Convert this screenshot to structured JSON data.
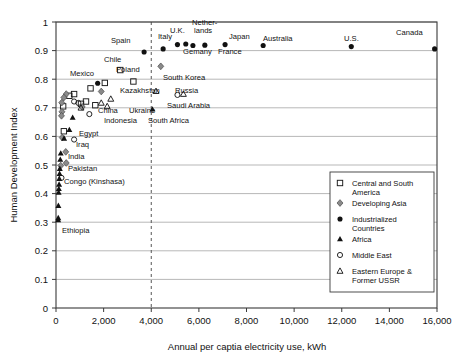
{
  "chart_data": {
    "type": "scatter",
    "title": "",
    "xlabel": "Annual per captia electricity use, kWh",
    "ylabel": "Human Development Index",
    "xlim": [
      0,
      16000
    ],
    "ylim": [
      0,
      1
    ],
    "xticks": [
      0,
      2000,
      4000,
      6000,
      8000,
      10000,
      12000,
      14000,
      16000
    ],
    "xticklabels": [
      "0",
      "2,000",
      "4,000",
      "6,000",
      "8,000",
      "10,000",
      "12,000",
      "14,000",
      "16,000"
    ],
    "yticks": [
      0,
      0.1,
      0.2,
      0.3,
      0.4,
      0.5,
      0.6,
      0.7,
      0.8,
      0.9,
      1
    ],
    "yticklabels": [
      "0",
      "0.1",
      "0.2",
      "0.3",
      "0.4",
      "0.5",
      "0.6",
      "0.7",
      "0.8",
      "0.9",
      "1"
    ],
    "grid": "horizontal",
    "legend_position": "bottom-right",
    "annotations": [
      {
        "name": "reference-line-4000",
        "type": "vline",
        "x": 4000,
        "style": "dashed"
      }
    ],
    "series": [
      {
        "name": "Central and South America",
        "marker": "open-square",
        "points": [
          {
            "x": 2700,
            "y": 0.832,
            "label": "Chile"
          },
          {
            "x": 3250,
            "y": 0.792,
            "label": ""
          },
          {
            "x": 1450,
            "y": 0.768,
            "label": ""
          },
          {
            "x": 760,
            "y": 0.748,
            "label": ""
          },
          {
            "x": 560,
            "y": 0.742,
            "label": ""
          },
          {
            "x": 1260,
            "y": 0.722,
            "label": ""
          },
          {
            "x": 1050,
            "y": 0.714,
            "label": ""
          },
          {
            "x": 1650,
            "y": 0.709,
            "label": ""
          },
          {
            "x": 300,
            "y": 0.705,
            "label": ""
          },
          {
            "x": 330,
            "y": 0.618,
            "label": ""
          },
          {
            "x": 2050,
            "y": 0.787,
            "label": "Poland"
          }
        ]
      },
      {
        "name": "Developing Asia",
        "marker": "diamond",
        "points": [
          {
            "x": 4400,
            "y": 0.845,
            "label": "South Korea"
          },
          {
            "x": 1900,
            "y": 0.757,
            "label": ""
          },
          {
            "x": 430,
            "y": 0.748,
            "label": ""
          },
          {
            "x": 330,
            "y": 0.736,
            "label": ""
          },
          {
            "x": 240,
            "y": 0.718,
            "label": ""
          },
          {
            "x": 1100,
            "y": 0.703,
            "label": "China"
          },
          {
            "x": 250,
            "y": 0.686,
            "label": ""
          },
          {
            "x": 230,
            "y": 0.672,
            "label": ""
          },
          {
            "x": 260,
            "y": 0.596,
            "label": ""
          },
          {
            "x": 410,
            "y": 0.546,
            "label": "India"
          },
          {
            "x": 430,
            "y": 0.507,
            "label": "Pakistan"
          },
          {
            "x": 200,
            "y": 0.498,
            "label": ""
          }
        ]
      },
      {
        "name": "Industrialized Countries",
        "marker": "filled-circle",
        "points": [
          {
            "x": 15900,
            "y": 0.906,
            "label": "Canada"
          },
          {
            "x": 12400,
            "y": 0.914,
            "label": "U.S."
          },
          {
            "x": 8700,
            "y": 0.918,
            "label": "Australia"
          },
          {
            "x": 7100,
            "y": 0.921,
            "label": "Japan"
          },
          {
            "x": 5750,
            "y": 0.918,
            "label": "Gemany"
          },
          {
            "x": 6250,
            "y": 0.919,
            "label": "France"
          },
          {
            "x": 5450,
            "y": 0.923,
            "label": "Nether-lands"
          },
          {
            "x": 5100,
            "y": 0.921,
            "label": "U.K."
          },
          {
            "x": 4500,
            "y": 0.906,
            "label": "Italy"
          },
          {
            "x": 3700,
            "y": 0.895,
            "label": "Spain"
          },
          {
            "x": 1750,
            "y": 0.786,
            "label": "Mexico"
          }
        ]
      },
      {
        "name": "Africa",
        "marker": "triangle",
        "points": [
          {
            "x": 4050,
            "y": 0.695,
            "label": "South Africa"
          },
          {
            "x": 700,
            "y": 0.666,
            "label": ""
          },
          {
            "x": 560,
            "y": 0.623,
            "label": "Egypt"
          },
          {
            "x": 340,
            "y": 0.593,
            "label": ""
          },
          {
            "x": 200,
            "y": 0.541,
            "label": ""
          },
          {
            "x": 180,
            "y": 0.519,
            "label": ""
          },
          {
            "x": 160,
            "y": 0.487,
            "label": "Congo (Kinshasa)"
          },
          {
            "x": 150,
            "y": 0.47,
            "label": ""
          },
          {
            "x": 140,
            "y": 0.452,
            "label": ""
          },
          {
            "x": 130,
            "y": 0.432,
            "label": ""
          },
          {
            "x": 120,
            "y": 0.417,
            "label": ""
          },
          {
            "x": 110,
            "y": 0.404,
            "label": ""
          },
          {
            "x": 100,
            "y": 0.358,
            "label": ""
          },
          {
            "x": 95,
            "y": 0.315,
            "label": ""
          },
          {
            "x": 90,
            "y": 0.308,
            "label": "Ethiopia"
          }
        ]
      },
      {
        "name": "Middle East",
        "marker": "open-circle",
        "points": [
          {
            "x": 5100,
            "y": 0.745,
            "label": ""
          },
          {
            "x": 760,
            "y": 0.722,
            "label": ""
          },
          {
            "x": 940,
            "y": 0.717,
            "label": ""
          },
          {
            "x": 1400,
            "y": 0.678,
            "label": "Indonesia"
          },
          {
            "x": 760,
            "y": 0.589,
            "label": "Iraq"
          },
          {
            "x": 230,
            "y": 0.455,
            "label": ""
          }
        ]
      },
      {
        "name": "Eastern Europe & Former USSR",
        "marker": "open-triangle",
        "points": [
          {
            "x": 4200,
            "y": 0.758,
            "label": "Kazakhstan"
          },
          {
            "x": 5350,
            "y": 0.748,
            "label": "Russia"
          },
          {
            "x": 2300,
            "y": 0.731,
            "label": ""
          },
          {
            "x": 1900,
            "y": 0.717,
            "label": ""
          },
          {
            "x": 2150,
            "y": 0.705,
            "label": "Ukraine"
          },
          {
            "x": 1050,
            "y": 0.7,
            "label": ""
          }
        ]
      }
    ]
  },
  "legend": {
    "entries": [
      {
        "marker": "open-square",
        "label_line1": "Central and South",
        "label_line2": "America"
      },
      {
        "marker": "diamond",
        "label_line1": "Developing Asia",
        "label_line2": ""
      },
      {
        "marker": "filled-circle",
        "label_line1": "Industrialized",
        "label_line2": "Countries"
      },
      {
        "marker": "triangle",
        "label_line1": "Africa",
        "label_line2": ""
      },
      {
        "marker": "open-circle",
        "label_line1": "Middle East",
        "label_line2": ""
      },
      {
        "marker": "open-triangle",
        "label_line1": "Eastern Europe &",
        "label_line2": "Former USSR"
      }
    ]
  },
  "point_labels": [
    {
      "name": "label-canada",
      "text": "Canada",
      "x": 396,
      "y": 35,
      "anchor": "start"
    },
    {
      "name": "label-us",
      "text": "U.S.",
      "x": 344,
      "y": 41,
      "anchor": "start"
    },
    {
      "name": "label-australia",
      "text": "Australia",
      "x": 263,
      "y": 41,
      "anchor": "start"
    },
    {
      "name": "label-japan",
      "text": "Japan",
      "x": 229,
      "y": 39,
      "anchor": "start"
    },
    {
      "name": "label-netherlands-1",
      "text": "Nether-",
      "x": 192,
      "y": 25,
      "anchor": "start"
    },
    {
      "name": "label-netherlands-2",
      "text": "lands",
      "x": 194,
      "y": 33,
      "anchor": "start"
    },
    {
      "name": "label-uk",
      "text": "U.K.",
      "x": 170,
      "y": 33,
      "anchor": "start"
    },
    {
      "name": "label-italy",
      "text": "Italy",
      "x": 158,
      "y": 39,
      "anchor": "start"
    },
    {
      "name": "label-spain",
      "text": "Spain",
      "x": 111,
      "y": 43,
      "anchor": "start"
    },
    {
      "name": "label-gemany",
      "text": "Gemany",
      "x": 183,
      "y": 54,
      "anchor": "start"
    },
    {
      "name": "label-france",
      "text": "France",
      "x": 218,
      "y": 54,
      "anchor": "start"
    },
    {
      "name": "label-chile",
      "text": "Chile",
      "x": 104,
      "y": 62,
      "anchor": "start"
    },
    {
      "name": "label-poland",
      "text": "Poland",
      "x": 116,
      "y": 72,
      "anchor": "start"
    },
    {
      "name": "label-south-korea",
      "text": "South Korea",
      "x": 163,
      "y": 80,
      "anchor": "start"
    },
    {
      "name": "label-mexico",
      "text": "Mexico",
      "x": 70,
      "y": 76,
      "anchor": "start"
    },
    {
      "name": "label-kazakhstan",
      "text": "Kazakhstan",
      "x": 120,
      "y": 93,
      "anchor": "start"
    },
    {
      "name": "label-russia",
      "text": "Russia",
      "x": 175,
      "y": 93,
      "anchor": "start"
    },
    {
      "name": "label-saudi-arabia",
      "text": "Saudi Arabia",
      "x": 167,
      "y": 108,
      "anchor": "start"
    },
    {
      "name": "label-china",
      "text": "China",
      "x": 98,
      "y": 113,
      "anchor": "start"
    },
    {
      "name": "label-ukraine",
      "text": "Ukraine",
      "x": 129,
      "y": 113,
      "anchor": "start"
    },
    {
      "name": "label-indonesia",
      "text": "Indonesia",
      "x": 104,
      "y": 123,
      "anchor": "start"
    },
    {
      "name": "label-south-africa",
      "text": "South Africa",
      "x": 148,
      "y": 123,
      "anchor": "start"
    },
    {
      "name": "label-egypt",
      "text": "Egypt",
      "x": 79,
      "y": 136,
      "anchor": "start"
    },
    {
      "name": "label-iraq",
      "text": "Iraq",
      "x": 76,
      "y": 147,
      "anchor": "start"
    },
    {
      "name": "label-india",
      "text": "India",
      "x": 68,
      "y": 159,
      "anchor": "start"
    },
    {
      "name": "label-pakistan",
      "text": "Pakistan",
      "x": 68,
      "y": 171,
      "anchor": "start"
    },
    {
      "name": "label-congo",
      "text": "Congo (Kinshasa)",
      "x": 64,
      "y": 184,
      "anchor": "start"
    },
    {
      "name": "label-ethiopia",
      "text": "Ethiopia",
      "x": 62,
      "y": 233,
      "anchor": "start"
    }
  ]
}
